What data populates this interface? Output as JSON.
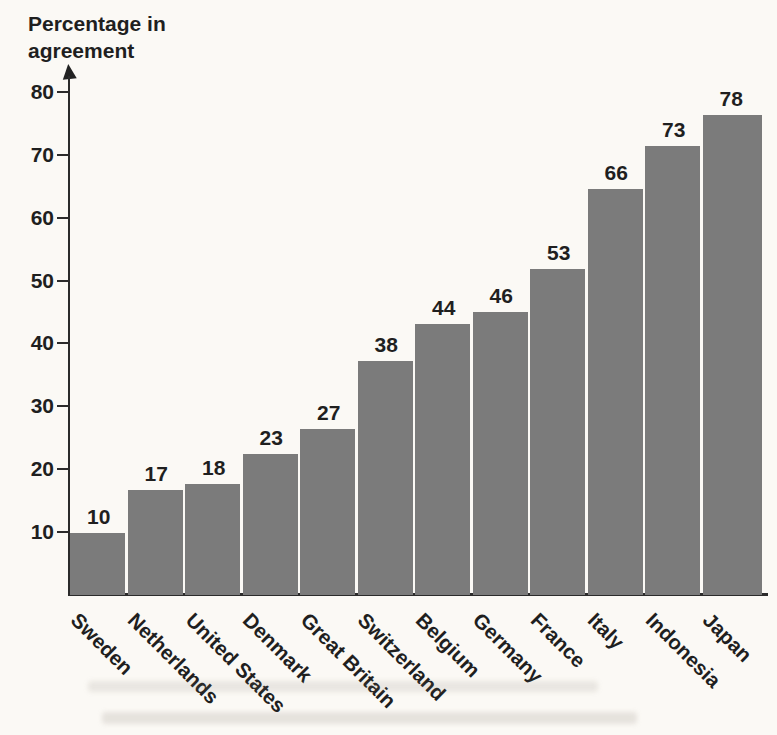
{
  "labels": {
    "y_axis_title_lines": [
      "Percentage in",
      "agreement"
    ]
  },
  "chart_data": {
    "type": "bar",
    "ylabel": "Percentage in agreement",
    "xlabel": "",
    "categories": [
      "Sweden",
      "Netherlands",
      "United States",
      "Denmark",
      "Great Britain",
      "Switzerland",
      "Belgium",
      "Germany",
      "France",
      "Italy",
      "Indonesia",
      "Japan"
    ],
    "values": [
      10,
      17,
      18,
      23,
      27,
      38,
      44,
      46,
      53,
      66,
      73,
      78
    ],
    "y_ticks": [
      10,
      20,
      30,
      40,
      50,
      60,
      70,
      80
    ],
    "ylim": [
      0,
      85
    ],
    "grid": false,
    "legend": "none",
    "value_labels_shown": true,
    "x_tick_rotation_deg": 45,
    "bar_color": "#7b7b7b",
    "axis_color": "#2b2b2b",
    "text_color": "#1f1f1f",
    "background_color": "#fbf9f5"
  }
}
